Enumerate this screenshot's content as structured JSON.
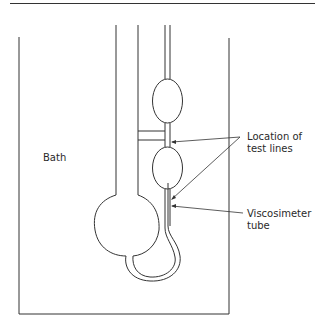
{
  "figure": {
    "labels": {
      "bath": "Bath",
      "test_lines_1": "Location of",
      "test_lines_2": "test lines",
      "tube_1": "Viscosimeter",
      "tube_2": "tube"
    },
    "colors": {
      "line": "#333333",
      "background": "#ffffff"
    }
  }
}
